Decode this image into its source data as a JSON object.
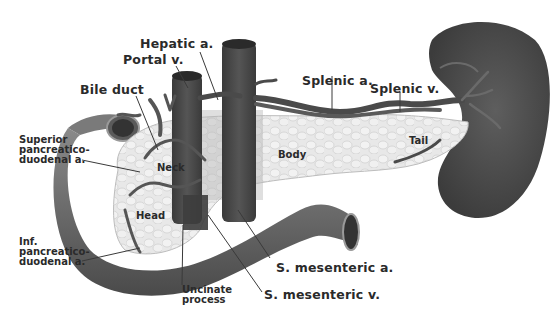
{
  "diagram": {
    "labels": {
      "hepatic_a": "Hepatic a.",
      "portal_v": "Portal v.",
      "bile_duct": "Bile duct",
      "splenic_a": "Splenic a.",
      "splenic_v": "Splenic v.",
      "sup_pd_a": "Superior\npancreatico-\nduodenal a.",
      "inf_pd_a": "Inf.\npancreatico-\nduodenal a.",
      "s_mesenteric_a": "S. mesenteric a.",
      "s_mesenteric_v": "S. mesenteric v.",
      "uncinate": "Uncinate\nprocess"
    },
    "regions": {
      "neck": "Neck",
      "body": "Body",
      "head": "Head",
      "tail": "Tail"
    },
    "colors": {
      "vessel": "#4a4a4a",
      "duodenum": "#6e6e6e",
      "pancreas": "#e6e6e6",
      "spleen": "#555555",
      "text": "#2a2a2a"
    }
  }
}
